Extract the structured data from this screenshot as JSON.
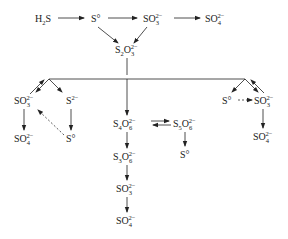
{
  "diagram": {
    "type": "reaction-pathway",
    "nodes": {
      "h2s": {
        "base": "H",
        "sub": "2",
        "tail": "S"
      },
      "s0_top": {
        "base": "S°"
      },
      "so3_top": {
        "base": "SO",
        "sub": "3",
        "sup": "2−"
      },
      "so4_top": {
        "base": "SO",
        "sub": "4",
        "sup": "2−"
      },
      "s2o3": {
        "base": "S",
        "sub": "2",
        "mid": "O",
        "sub2": "3",
        "sup": "2−"
      },
      "left_so3": {
        "base": "SO",
        "sub": "3",
        "sup": "2−"
      },
      "left_s2": {
        "base": "S",
        "sup": "2−"
      },
      "left_so4": {
        "base": "SO",
        "sub": "4",
        "sup": "2−"
      },
      "left_s0": {
        "base": "S°"
      },
      "s4o6": {
        "base": "S",
        "sub": "4",
        "mid": "O",
        "sub2": "6",
        "sup": "2−"
      },
      "s5o6": {
        "base": "S",
        "sub": "5",
        "mid": "O",
        "sub2": "6",
        "sup": "2−"
      },
      "s0_mid": {
        "base": "S°"
      },
      "s3o6": {
        "base": "S",
        "sub": "3",
        "mid": "O",
        "sub2": "6",
        "sup": "2−"
      },
      "so3_mid": {
        "base": "SO",
        "sub": "3",
        "sup": "2−"
      },
      "so4_mid": {
        "base": "SO",
        "sub": "4",
        "sup": "2−"
      },
      "right_s0": {
        "base": "S°"
      },
      "right_so3": {
        "base": "SO",
        "sub": "3",
        "sup": "2−"
      },
      "right_so4": {
        "base": "SO",
        "sub": "4",
        "sup": "2−"
      }
    },
    "edges": [
      {
        "from": "H2S",
        "to": "S°",
        "style": "solid"
      },
      {
        "from": "S°",
        "to": "SO3 2−",
        "style": "solid"
      },
      {
        "from": "SO3 2−",
        "to": "SO4 2−",
        "style": "solid"
      },
      {
        "from": "S°",
        "to": "S2O3 2−",
        "style": "solid"
      },
      {
        "from": "SO3 2−",
        "to": "S2O3 2−",
        "style": "solid"
      },
      {
        "from": "S2O3 2−",
        "to": "left branch / S4O6 2− / right branch",
        "style": "solid"
      },
      {
        "from": "branch",
        "to": "SO3 2− (left)",
        "style": "solid, bidirectional"
      },
      {
        "from": "branch",
        "to": "S 2− (left)",
        "style": "solid"
      },
      {
        "from": "SO3 2− (left)",
        "to": "SO4 2− (left)",
        "style": "solid"
      },
      {
        "from": "S 2− (left)",
        "to": "S° (left)",
        "style": "solid"
      },
      {
        "from": "S° (left)",
        "to": "SO3 2− (left)",
        "style": "dashed"
      },
      {
        "from": "S4O6 2−",
        "to": "S5O6 2−",
        "style": "solid, reversible"
      },
      {
        "from": "S5O6 2−",
        "to": "S°",
        "style": "solid"
      },
      {
        "from": "S4O6 2−",
        "to": "S3O6 2−",
        "style": "solid"
      },
      {
        "from": "S3O6 2−",
        "to": "SO3 2−",
        "style": "solid"
      },
      {
        "from": "SO3 2−",
        "to": "SO4 2−",
        "style": "solid"
      },
      {
        "from": "branch",
        "to": "S° (right)",
        "style": "solid"
      },
      {
        "from": "branch",
        "to": "SO3 2− (right)",
        "style": "solid, bidirectional"
      },
      {
        "from": "S° (right)",
        "to": "SO3 2− (right)",
        "style": "dashed"
      },
      {
        "from": "SO3 2− (right)",
        "to": "SO4 2− (right)",
        "style": "solid"
      }
    ]
  }
}
